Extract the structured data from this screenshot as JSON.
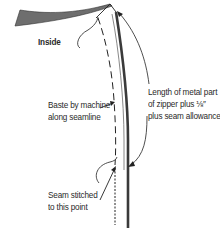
{
  "diagram": {
    "labels": {
      "inside": "Inside",
      "metal_length": {
        "line1": "Length of metal part",
        "line2": "of zipper plus ⅛″",
        "line3": "plus seam allowance"
      },
      "baste": {
        "line1": "Baste by machine",
        "line2": "along seamline"
      },
      "seam": {
        "line1": "Seam stitched",
        "line2": "to this point"
      }
    },
    "colors": {
      "fabric_fold": "#6e6e6e",
      "zipper_line": "#3a3a3a",
      "stroke": "#222222",
      "text": "#2a2a2a",
      "background": "#ffffff"
    }
  }
}
